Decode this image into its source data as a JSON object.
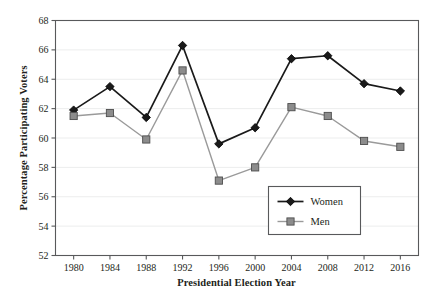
{
  "chart_data": {
    "type": "line",
    "title": "",
    "xlabel": "Presidential Election Year",
    "ylabel": "Percentage Participating Voters",
    "categories": [
      1980,
      1984,
      1988,
      1992,
      1996,
      2000,
      2004,
      2008,
      2012,
      2016
    ],
    "x_tick_labels": [
      "1980",
      "1984",
      "1988",
      "1992",
      "1996",
      "2000",
      "2004",
      "2008",
      "2012",
      "2016"
    ],
    "y_tick_labels": [
      "52",
      "54",
      "56",
      "58",
      "60",
      "62",
      "64",
      "66",
      "68"
    ],
    "y_ticks": [
      52,
      54,
      56,
      58,
      60,
      62,
      64,
      66,
      68
    ],
    "ylim": [
      52,
      68
    ],
    "grid": "horizontal",
    "legend_position": "lower-right-inside",
    "series": [
      {
        "name": "Women",
        "marker": "diamond",
        "color": "#1a1a1a",
        "line_color": "#1a1a1a",
        "values": [
          61.9,
          63.5,
          61.4,
          66.3,
          59.6,
          60.7,
          65.4,
          65.6,
          63.7,
          63.2
        ]
      },
      {
        "name": "Men",
        "marker": "square",
        "color": "#8c8c8c",
        "line_color": "#9a9a9a",
        "values": [
          61.5,
          61.7,
          59.9,
          64.6,
          57.1,
          58.0,
          62.1,
          61.5,
          59.8,
          59.4
        ]
      }
    ]
  },
  "legend": {
    "items": [
      {
        "label": "Women"
      },
      {
        "label": "Men"
      }
    ]
  },
  "axes": {
    "x_title": "Presidential Election Year",
    "y_title": "Percentage Participating Voters"
  },
  "colors": {
    "women": "#1a1a1a",
    "men": "#8c8c8c",
    "men_line": "#9a9a9a",
    "axis": "#58595b",
    "grid": "#eceded",
    "text": "#231f20",
    "background": "#ffffff"
  }
}
